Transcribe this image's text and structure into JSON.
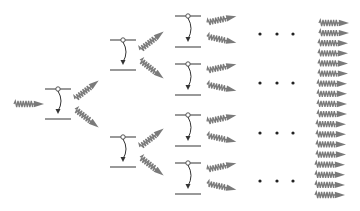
{
  "diagram": {
    "type": "photon cascade tree",
    "colors": {
      "photon": "#7a7a7a",
      "level_line": "#555555",
      "transition_arrow": "#333333",
      "dots": "#222222",
      "background": "#ffffff"
    },
    "incoming_photon": {
      "x": 14,
      "y": 104
    },
    "stages": [
      {
        "name": "stage-1",
        "atoms": [
          {
            "x": 45,
            "upper_y": 89,
            "lower_y": 119
          }
        ]
      },
      {
        "name": "stage-2",
        "atoms": [
          {
            "x": 110,
            "upper_y": 40,
            "lower_y": 70
          },
          {
            "x": 110,
            "upper_y": 137,
            "lower_y": 167
          }
        ]
      },
      {
        "name": "stage-3",
        "atoms": [
          {
            "x": 175,
            "upper_y": 16,
            "lower_y": 47
          },
          {
            "x": 175,
            "upper_y": 64,
            "lower_y": 95
          },
          {
            "x": 175,
            "upper_y": 115,
            "lower_y": 146
          },
          {
            "x": 175,
            "upper_y": 163,
            "lower_y": 194
          }
        ]
      }
    ],
    "ellipsis_rows_y": [
      34,
      83,
      133,
      181
    ],
    "ellipsis_label": "• • •",
    "output_photon_count": 18
  }
}
